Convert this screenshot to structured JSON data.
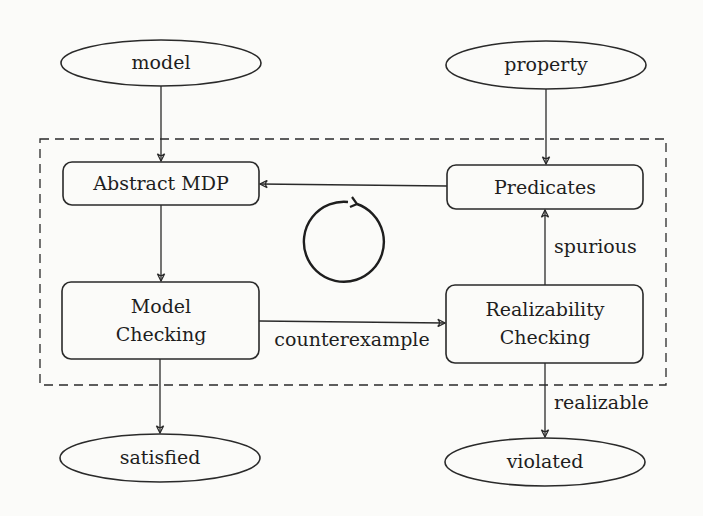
{
  "diagram": {
    "type": "flowchart",
    "colors": {
      "stroke": "#2a2a2a",
      "text": "#1e1e1e",
      "background": "#fbfbf9"
    },
    "inputs": {
      "model": {
        "label": "model",
        "shape": "ellipse"
      },
      "property": {
        "label": "property",
        "shape": "ellipse"
      }
    },
    "outputs": {
      "satisfied": {
        "label": "satisfied",
        "shape": "ellipse"
      },
      "violated": {
        "label": "violated",
        "shape": "ellipse"
      }
    },
    "loop": {
      "frame_style": "dashed",
      "cycle_icon": "counterclockwise-cycle-arrow",
      "nodes": {
        "abstract_mdp": {
          "label": "Abstract MDP",
          "shape": "rounded-rect"
        },
        "predicates": {
          "label": "Predicates",
          "shape": "rounded-rect"
        },
        "model_checking": {
          "label_line1": "Model",
          "label_line2": "Checking",
          "shape": "rounded-rect"
        },
        "realizability_checking": {
          "label_line1": "Realizability",
          "label_line2": "Checking",
          "shape": "rounded-rect"
        }
      }
    },
    "edges": [
      {
        "from": "model",
        "to": "abstract_mdp",
        "label": ""
      },
      {
        "from": "property",
        "to": "predicates",
        "label": ""
      },
      {
        "from": "predicates",
        "to": "abstract_mdp",
        "label": ""
      },
      {
        "from": "abstract_mdp",
        "to": "model_checking",
        "label": ""
      },
      {
        "from": "model_checking",
        "to": "realizability_checking",
        "label": "counterexample"
      },
      {
        "from": "realizability_checking",
        "to": "predicates",
        "label": "spurious"
      },
      {
        "from": "model_checking",
        "to": "satisfied",
        "label": ""
      },
      {
        "from": "realizability_checking",
        "to": "violated",
        "label": "realizable"
      }
    ],
    "edge_labels": {
      "counterexample": "counterexample",
      "spurious": "spurious",
      "realizable": "realizable"
    }
  }
}
